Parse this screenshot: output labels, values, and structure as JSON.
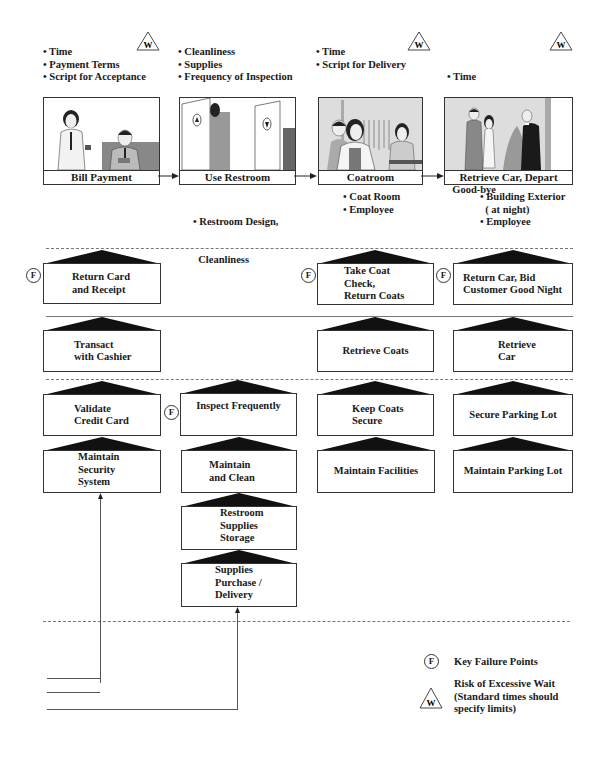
{
  "steps": [
    {
      "caption": "Bill Payment",
      "standards": [
        "• Time",
        "• Payment Terms",
        "• Script for Acceptance"
      ],
      "wait_risk": true,
      "evidence": []
    },
    {
      "caption": "Use Restroom",
      "standards": [
        "• Cleanliness",
        "• Supplies",
        "• Frequency of Inspection"
      ],
      "wait_risk": false,
      "evidence": [
        "• Restroom Design,",
        "  Cleanliness"
      ]
    },
    {
      "caption": "Coatroom",
      "standards": [
        "• Time",
        "• Script for Delivery"
      ],
      "wait_risk": true,
      "evidence": [
        "• Coat Room",
        "• Employee"
      ]
    },
    {
      "caption": "Retrieve Car, Depart",
      "standards": [
        "• Time",
        "• Script for Car",
        "  Delivery and",
        "  Good-bye"
      ],
      "wait_risk": true,
      "evidence": [
        "• Building Exterior",
        "  ( at night)",
        "• Employee"
      ]
    }
  ],
  "wait_symbol": "W",
  "fail_symbol": "F",
  "onstage": [
    {
      "label": "Return Card\nand Receipt",
      "fail_point": true
    },
    {
      "label": "Take Coat\nCheck,\nReturn Coats",
      "fail_point": true
    },
    {
      "label": "Return Car, Bid\nCustomer Good Night",
      "fail_point": true
    }
  ],
  "backstage": [
    {
      "label": "Transact\nwith Cashier"
    },
    {
      "label": "Retrieve Coats"
    },
    {
      "label": "Retrieve\nCar"
    }
  ],
  "support_row1": [
    {
      "label": "Validate\nCredit Card",
      "fail_point": false
    },
    {
      "label": "Inspect Frequently",
      "fail_point": true
    },
    {
      "label": "Keep Coats\nSecure",
      "fail_point": false
    },
    {
      "label": "Secure Parking Lot",
      "fail_point": false
    }
  ],
  "support_row2": [
    {
      "label": "Maintain\nSecurity\nSystem"
    },
    {
      "label": "Maintain\nand Clean"
    },
    {
      "label": "Maintain Facilities"
    },
    {
      "label": "Maintain Parking Lot"
    }
  ],
  "support_row3": [
    {
      "label": "Restroom\nSupplies\nStorage"
    }
  ],
  "support_row4": [
    {
      "label": "Supplies\nPurchase /\nDelivery"
    }
  ],
  "legend": {
    "fail_label": "Key Failure Points",
    "wait_label": "Risk of Excessive Wait\n(Standard times should\nspecify limits)"
  }
}
